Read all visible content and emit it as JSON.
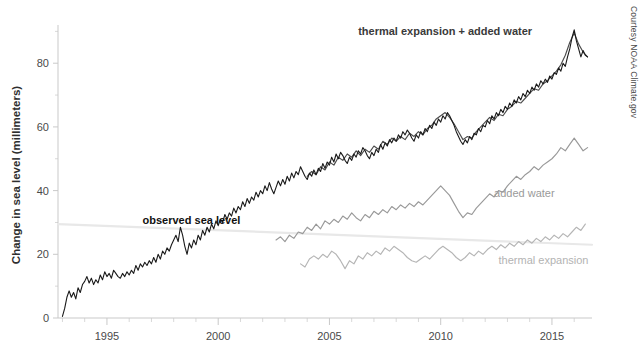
{
  "credit": "Courtesy NOAA Climate.gov",
  "axes": {
    "y_title": "Change in sea level (millimeters)",
    "y_ticks": [
      0,
      20,
      40,
      60,
      80
    ],
    "x_ticks": [
      1995,
      2000,
      2005,
      2010,
      2015
    ],
    "x_minor_step": 1
  },
  "labels": {
    "observed": "observed sea level",
    "sum": "thermal expansion + added water",
    "added_water": "added water",
    "thermal_expansion": "thermal expansion"
  },
  "colors": {
    "observed": "#1a1a1a",
    "sum": "#4d4d4d",
    "added_water": "#999999",
    "thermal_expansion": "#b5b5b5",
    "trend_guide": "#e8e8e8",
    "axis": "#c9c9c9"
  },
  "chart_data": {
    "type": "line",
    "title": "",
    "subtitle": "",
    "xlabel": "",
    "ylabel": "Change in sea level (millimeters)",
    "xlim": [
      1992.8,
      2016.8
    ],
    "ylim": [
      0,
      92
    ],
    "grid": false,
    "legend": "inline-annotations",
    "annotations": [
      {
        "text": "observed sea level",
        "x": 1996.6,
        "y": 29.5
      },
      {
        "text": "thermal expansion + added water",
        "x": 2010.2,
        "y": 89
      },
      {
        "text": "added water",
        "x": 2012.4,
        "y": 38
      },
      {
        "text": "thermal expansion",
        "x": 2012.6,
        "y": 17
      }
    ],
    "guide_line": {
      "x": [
        1992.8,
        2016.8
      ],
      "y": [
        29.5,
        23.0
      ],
      "color": "#e8e8e8"
    },
    "series": [
      {
        "name": "observed sea level",
        "color": "#1a1a1a",
        "x": [
          1993.0,
          1993.1,
          1993.2,
          1993.3,
          1993.4,
          1993.5,
          1993.6,
          1993.7,
          1993.8,
          1993.9,
          1994.0,
          1994.1,
          1994.2,
          1994.3,
          1994.4,
          1994.5,
          1994.6,
          1994.7,
          1994.8,
          1994.9,
          1995.0,
          1995.1,
          1995.2,
          1995.3,
          1995.4,
          1995.5,
          1995.6,
          1995.7,
          1995.8,
          1995.9,
          1996.0,
          1996.1,
          1996.2,
          1996.3,
          1996.4,
          1996.5,
          1996.6,
          1996.7,
          1996.8,
          1996.9,
          1997.0,
          1997.1,
          1997.2,
          1997.3,
          1997.4,
          1997.5,
          1997.6,
          1997.7,
          1997.8,
          1997.9,
          1998.0,
          1998.1,
          1998.2,
          1998.3,
          1998.4,
          1998.5,
          1998.6,
          1998.7,
          1998.8,
          1998.9,
          1999.0,
          1999.1,
          1999.2,
          1999.3,
          1999.4,
          1999.5,
          1999.6,
          1999.7,
          1999.8,
          1999.9,
          2000.0,
          2000.1,
          2000.2,
          2000.3,
          2000.4,
          2000.5,
          2000.6,
          2000.7,
          2000.8,
          2000.9,
          2001.0,
          2001.1,
          2001.2,
          2001.3,
          2001.4,
          2001.5,
          2001.6,
          2001.7,
          2001.8,
          2001.9,
          2002.0,
          2002.1,
          2002.2,
          2002.3,
          2002.4,
          2002.5,
          2002.6,
          2002.7,
          2002.8,
          2002.9,
          2003.0,
          2003.1,
          2003.2,
          2003.3,
          2003.4,
          2003.5,
          2003.6,
          2003.7,
          2003.8,
          2003.9,
          2004.0,
          2004.1,
          2004.2,
          2004.3,
          2004.4,
          2004.5,
          2004.6,
          2004.7,
          2004.8,
          2004.9,
          2005.0,
          2005.1,
          2005.2,
          2005.3,
          2005.4,
          2005.5,
          2005.6,
          2005.7,
          2005.8,
          2005.9,
          2006.0,
          2006.1,
          2006.2,
          2006.3,
          2006.4,
          2006.5,
          2006.6,
          2006.7,
          2006.8,
          2006.9,
          2007.0,
          2007.1,
          2007.2,
          2007.3,
          2007.4,
          2007.5,
          2007.6,
          2007.7,
          2007.8,
          2007.9,
          2008.0,
          2008.1,
          2008.2,
          2008.3,
          2008.4,
          2008.5,
          2008.6,
          2008.7,
          2008.8,
          2008.9,
          2009.0,
          2009.1,
          2009.2,
          2009.3,
          2009.4,
          2009.5,
          2009.6,
          2009.7,
          2009.8,
          2009.9,
          2010.0,
          2010.1,
          2010.2,
          2010.3,
          2010.4,
          2010.5,
          2010.6,
          2010.7,
          2010.8,
          2010.9,
          2011.0,
          2011.1,
          2011.2,
          2011.3,
          2011.4,
          2011.5,
          2011.6,
          2011.7,
          2011.8,
          2011.9,
          2012.0,
          2012.1,
          2012.2,
          2012.3,
          2012.4,
          2012.5,
          2012.6,
          2012.7,
          2012.8,
          2012.9,
          2013.0,
          2013.1,
          2013.2,
          2013.3,
          2013.4,
          2013.5,
          2013.6,
          2013.7,
          2013.8,
          2013.9,
          2014.0,
          2014.1,
          2014.2,
          2014.3,
          2014.4,
          2014.5,
          2014.6,
          2014.7,
          2014.8,
          2014.9,
          2015.0,
          2015.1,
          2015.2,
          2015.3,
          2015.4,
          2015.5,
          2015.6,
          2015.7,
          2015.8,
          2015.9,
          2016.0,
          2016.1,
          2016.2,
          2016.3,
          2016.4,
          2016.5,
          2016.6
        ],
        "y": [
          0.5,
          3.0,
          6.5,
          8.5,
          6.5,
          8.0,
          6.0,
          9.5,
          8.0,
          10.5,
          11.5,
          13.0,
          11.0,
          12.5,
          10.5,
          12.0,
          11.0,
          13.5,
          12.0,
          14.5,
          13.0,
          14.0,
          12.5,
          15.0,
          14.0,
          13.0,
          12.5,
          14.0,
          13.0,
          14.5,
          13.5,
          15.0,
          14.0,
          16.5,
          15.0,
          17.0,
          16.0,
          17.5,
          16.5,
          18.0,
          17.0,
          19.0,
          17.5,
          20.0,
          18.5,
          21.0,
          20.0,
          22.0,
          21.0,
          23.0,
          24.5,
          26.0,
          24.0,
          28.5,
          26.0,
          22.5,
          20.0,
          23.5,
          22.0,
          24.5,
          23.0,
          26.0,
          24.5,
          27.5,
          26.0,
          28.5,
          27.0,
          29.5,
          28.0,
          30.5,
          29.0,
          31.0,
          30.0,
          32.5,
          31.0,
          33.0,
          32.0,
          34.5,
          33.0,
          35.0,
          34.0,
          36.5,
          35.0,
          37.5,
          36.0,
          38.0,
          37.0,
          39.5,
          38.0,
          40.0,
          39.0,
          41.5,
          40.0,
          42.5,
          40.5,
          39.0,
          41.0,
          43.0,
          41.5,
          43.5,
          42.0,
          44.5,
          43.0,
          45.5,
          44.0,
          46.0,
          45.0,
          47.5,
          46.0,
          44.5,
          43.5,
          45.5,
          44.5,
          46.5,
          45.0,
          47.0,
          46.0,
          48.5,
          47.0,
          49.0,
          48.0,
          50.5,
          49.0,
          51.5,
          50.0,
          52.0,
          51.0,
          49.5,
          48.5,
          50.5,
          49.5,
          51.5,
          50.5,
          52.5,
          51.5,
          53.5,
          52.5,
          51.0,
          50.0,
          52.0,
          51.0,
          53.0,
          52.0,
          54.5,
          53.0,
          55.0,
          54.0,
          56.0,
          55.0,
          56.5,
          55.5,
          57.5,
          56.5,
          58.5,
          57.5,
          59.0,
          58.0,
          56.5,
          55.5,
          57.5,
          56.5,
          58.5,
          57.5,
          59.5,
          58.5,
          60.5,
          59.5,
          61.5,
          60.5,
          62.5,
          61.5,
          63.5,
          62.5,
          64.5,
          63.5,
          62.0,
          60.5,
          58.5,
          57.0,
          55.5,
          54.5,
          56.0,
          55.0,
          57.0,
          56.0,
          58.0,
          57.5,
          59.5,
          58.5,
          60.5,
          60.0,
          62.0,
          61.0,
          63.5,
          62.5,
          64.5,
          63.5,
          65.5,
          64.5,
          66.5,
          65.5,
          67.5,
          66.5,
          68.5,
          67.5,
          69.5,
          68.5,
          70.5,
          69.5,
          71.5,
          70.5,
          72.5,
          71.5,
          73.5,
          72.5,
          74.5,
          73.5,
          75.0,
          74.0,
          76.0,
          75.0,
          77.0,
          76.5,
          78.5,
          77.5,
          80.0,
          79.0,
          82.0,
          84.5,
          88.0,
          90.5,
          87.0,
          84.5,
          82.0,
          84.0,
          82.5,
          82.0
        ]
      },
      {
        "name": "thermal expansion + added water",
        "color": "#4d4d4d",
        "x": [
          2004.0,
          2004.2,
          2004.4,
          2004.6,
          2004.8,
          2005.0,
          2005.2,
          2005.4,
          2005.6,
          2005.8,
          2006.0,
          2006.2,
          2006.4,
          2006.6,
          2006.8,
          2007.0,
          2007.2,
          2007.4,
          2007.6,
          2007.8,
          2008.0,
          2008.2,
          2008.4,
          2008.6,
          2008.8,
          2009.0,
          2009.2,
          2009.4,
          2009.6,
          2009.8,
          2010.0,
          2010.2,
          2010.4,
          2010.6,
          2010.8,
          2011.0,
          2011.2,
          2011.4,
          2011.6,
          2011.8,
          2012.0,
          2012.2,
          2012.4,
          2012.6,
          2012.8,
          2013.0,
          2013.2,
          2013.4,
          2013.6,
          2013.8,
          2014.0,
          2014.2,
          2014.4,
          2014.6,
          2014.8,
          2015.0,
          2015.2,
          2015.4,
          2015.6,
          2015.8,
          2016.0,
          2016.2,
          2016.4,
          2016.6
        ],
        "y": [
          44.5,
          46.0,
          45.0,
          47.5,
          46.5,
          49.0,
          48.0,
          50.5,
          49.5,
          51.5,
          50.5,
          52.5,
          51.0,
          53.0,
          52.0,
          54.0,
          53.0,
          55.5,
          54.5,
          56.5,
          55.5,
          57.0,
          56.0,
          58.0,
          57.0,
          58.5,
          57.5,
          59.5,
          60.5,
          62.5,
          63.5,
          64.5,
          63.0,
          61.0,
          58.5,
          56.0,
          57.0,
          56.5,
          58.5,
          60.0,
          61.5,
          63.0,
          62.0,
          64.0,
          63.5,
          65.5,
          66.5,
          68.0,
          67.5,
          69.0,
          70.5,
          72.0,
          71.5,
          73.5,
          74.5,
          76.0,
          77.5,
          79.5,
          82.5,
          86.5,
          89.5,
          86.0,
          83.5,
          82.0
        ]
      },
      {
        "name": "added water",
        "color": "#999999",
        "x": [
          2002.6,
          2002.8,
          2003.0,
          2003.2,
          2003.4,
          2003.6,
          2003.8,
          2004.0,
          2004.2,
          2004.4,
          2004.6,
          2004.8,
          2005.0,
          2005.2,
          2005.4,
          2005.6,
          2005.8,
          2006.0,
          2006.2,
          2006.4,
          2006.6,
          2006.8,
          2007.0,
          2007.2,
          2007.4,
          2007.6,
          2007.8,
          2008.0,
          2008.2,
          2008.4,
          2008.6,
          2008.8,
          2009.0,
          2009.2,
          2009.4,
          2009.6,
          2009.8,
          2010.0,
          2010.2,
          2010.4,
          2010.6,
          2010.8,
          2011.0,
          2011.2,
          2011.4,
          2011.6,
          2011.8,
          2012.0,
          2012.2,
          2012.4,
          2012.6,
          2012.8,
          2013.0,
          2013.2,
          2013.4,
          2013.6,
          2013.8,
          2014.0,
          2014.2,
          2014.4,
          2014.6,
          2014.8,
          2015.0,
          2015.2,
          2015.4,
          2015.6,
          2015.8,
          2016.0,
          2016.2,
          2016.4,
          2016.6
        ],
        "y": [
          24.5,
          25.5,
          24.0,
          26.0,
          25.0,
          27.0,
          26.5,
          28.5,
          27.5,
          29.5,
          28.0,
          30.5,
          29.5,
          31.0,
          30.0,
          32.0,
          31.0,
          33.0,
          31.5,
          30.5,
          32.5,
          31.5,
          33.5,
          32.5,
          34.0,
          33.0,
          35.0,
          34.0,
          35.5,
          34.5,
          36.0,
          35.0,
          36.5,
          35.5,
          37.0,
          38.5,
          40.0,
          41.5,
          40.0,
          38.5,
          36.0,
          33.5,
          31.5,
          33.0,
          32.5,
          34.5,
          36.0,
          37.5,
          39.0,
          38.0,
          40.0,
          39.5,
          41.5,
          43.0,
          44.5,
          43.5,
          45.0,
          46.0,
          47.5,
          46.5,
          48.0,
          49.0,
          50.0,
          51.5,
          53.5,
          52.5,
          54.5,
          56.5,
          54.5,
          52.5,
          53.5
        ]
      },
      {
        "name": "thermal expansion",
        "color": "#b5b5b5",
        "x": [
          2003.7,
          2003.9,
          2004.1,
          2004.3,
          2004.5,
          2004.7,
          2004.9,
          2005.1,
          2005.3,
          2005.5,
          2005.7,
          2005.9,
          2006.1,
          2006.3,
          2006.5,
          2006.7,
          2006.9,
          2007.1,
          2007.3,
          2007.5,
          2007.7,
          2007.9,
          2008.1,
          2008.3,
          2008.5,
          2008.7,
          2008.9,
          2009.1,
          2009.3,
          2009.5,
          2009.7,
          2009.9,
          2010.1,
          2010.3,
          2010.5,
          2010.7,
          2010.9,
          2011.1,
          2011.3,
          2011.5,
          2011.7,
          2011.9,
          2012.1,
          2012.3,
          2012.5,
          2012.7,
          2012.9,
          2013.1,
          2013.3,
          2013.5,
          2013.7,
          2013.9,
          2014.1,
          2014.3,
          2014.5,
          2014.7,
          2014.9,
          2015.1,
          2015.3,
          2015.5,
          2015.7,
          2015.9,
          2016.1,
          2016.3,
          2016.5
        ],
        "y": [
          17.0,
          16.0,
          18.5,
          19.5,
          18.5,
          20.0,
          19.0,
          21.0,
          20.0,
          18.0,
          15.5,
          18.0,
          17.0,
          19.5,
          18.5,
          20.5,
          19.5,
          21.0,
          20.0,
          22.0,
          21.0,
          22.5,
          21.5,
          20.5,
          19.0,
          18.0,
          17.5,
          18.5,
          19.5,
          18.5,
          20.0,
          21.5,
          22.5,
          21.5,
          20.5,
          19.0,
          18.0,
          19.0,
          20.5,
          19.5,
          21.0,
          20.0,
          21.5,
          22.5,
          21.5,
          23.0,
          22.0,
          23.5,
          22.5,
          24.0,
          23.0,
          24.5,
          23.5,
          25.0,
          24.0,
          25.5,
          24.5,
          26.0,
          25.0,
          26.5,
          25.5,
          27.0,
          28.5,
          27.5,
          29.5
        ]
      }
    ]
  }
}
